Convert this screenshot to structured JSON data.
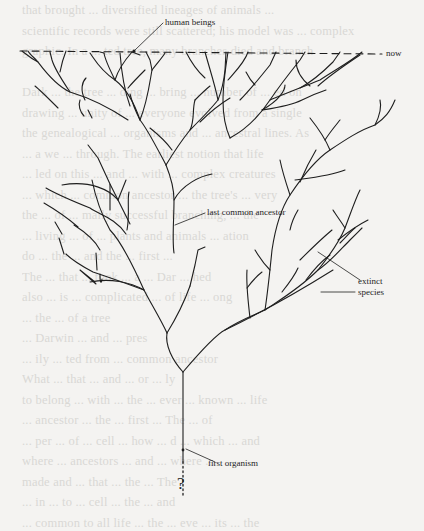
{
  "figure": {
    "type": "phylogenetic-tree",
    "labels": {
      "human_beings": "human beings",
      "now": "now",
      "last_common_ancestor": "last common ancestor",
      "extinct": "extinct",
      "species": "species",
      "first_organism": "first organism",
      "unknown_origin": "?"
    },
    "colors": {
      "ink": "#1e1e1e",
      "paper": "#f4f3f1",
      "bleed_text": "#d9d8d5"
    }
  },
  "bleed_through_text": [
    "that brought ... diversified lineages of animals ...",
    "scientific records were still scattered; his model was ... complex",
    "graphic. In a ... ted tree, many branches died and branch",
    "",
    "Dark ... the tree ... ding ... bring ... number of ... ed on",
    "drawing ... unity of ... everyone evolved from a single",
    "the genealogical ... organisms and ... ancestral lines. As",
    "... a we ... through. The earliest notion that life",
    "... led on this ... and ... with ... complex creatures",
    "... which ... common ancestor ... the tree's ... very",
    "the ... of ... mally successful branching, ... the",
    "... living ... of ... plants and animals ... ation",
    "do ... the ... and the ... first ...",
    "The ... that ... took ... a ... Dar ... hed",
    "also ... is ... complicated ... of life ... ong",
    "... the ... of a tree",
    "... Darwin ... and ... pres",
    "... ily ... ted from ... common ancestor",
    "What ... that ... and ... or ... ly",
    "to belong ... with ... the ... ever ... known ... life",
    "... ancestor ... the ... first ... The ... of",
    "... per ... of ... cell ... how ... d ... which ... and",
    "where ... ancestors ... and ... where ... ",
    "made and ... that ... the ... The",
    "... in ... to ... cell ... the ... and",
    "... common to all life ... the ... eve ... its ... the",
    "... from ... genetic ... we ... lied ... other",
    "... ... of ... and ... ... ... ... ..."
  ]
}
